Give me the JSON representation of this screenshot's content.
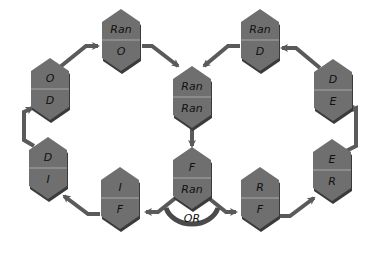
{
  "colors": {
    "hex_fill": "#6f6f6f",
    "hex_shadow": "#3a3a3a",
    "divider": "#a8a8a8",
    "arrow": "#5a5a5a",
    "text": "#111111"
  },
  "nodes": [
    {
      "id": "n-ran-ran",
      "top": "Ran",
      "bottom": "Ran",
      "cx": 192,
      "cy": 97
    },
    {
      "id": "n-f-ran",
      "top": "F",
      "bottom": "Ran",
      "cx": 192,
      "cy": 178
    },
    {
      "id": "n-ran-o",
      "top": "Ran",
      "bottom": "O",
      "cx": 121,
      "cy": 40
    },
    {
      "id": "n-o-d",
      "top": "O",
      "bottom": "D",
      "cx": 50,
      "cy": 89
    },
    {
      "id": "n-d-i",
      "top": "D",
      "bottom": "I",
      "cx": 48,
      "cy": 168
    },
    {
      "id": "n-i-f",
      "top": "I",
      "bottom": "F",
      "cx": 120,
      "cy": 198
    },
    {
      "id": "n-ran-d",
      "top": "Ran",
      "bottom": "D",
      "cx": 260,
      "cy": 40
    },
    {
      "id": "n-d-e",
      "top": "D",
      "bottom": "E",
      "cx": 333,
      "cy": 90
    },
    {
      "id": "n-e-r",
      "top": "E",
      "bottom": "R",
      "cx": 332,
      "cy": 170
    },
    {
      "id": "n-r-f",
      "top": "R",
      "bottom": "F",
      "cx": 260,
      "cy": 198
    }
  ],
  "branch_label": "OR"
}
